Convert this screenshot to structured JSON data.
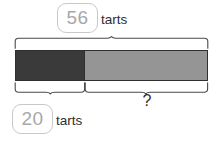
{
  "diagram": {
    "type": "bar-model",
    "background_color": "#ffffff",
    "total": {
      "value": "56",
      "unit_label": "tarts",
      "chip_text_color": "#a8a8a8",
      "chip_border_color": "#c9c9c9",
      "brace_name": "total-brace"
    },
    "known_part": {
      "value": "20",
      "unit_label": "tarts",
      "segment_color": "#3a3a3a",
      "chip_text_color": "#a8a8a8",
      "chip_border_color": "#c9c9c9",
      "brace_name": "known-part-brace"
    },
    "unknown_part": {
      "value": "?",
      "segment_color": "#959595",
      "brace_name": "unknown-part-brace"
    },
    "bar": {
      "border_color": "#2f2f2f",
      "brace_color": "#4a4a4a"
    },
    "icons": {
      "brace_total": "curly-brace-up-icon",
      "brace_part": "curly-brace-down-icon",
      "brace_remainder": "curly-brace-down-icon"
    }
  }
}
